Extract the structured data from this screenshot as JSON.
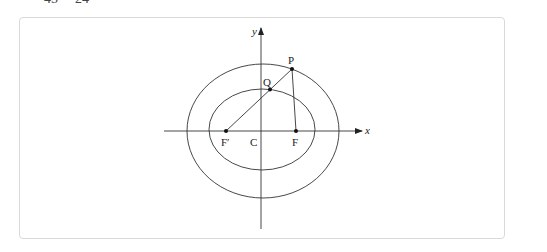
{
  "clipped_text": {
    "left": "45",
    "right": "24"
  },
  "figure": {
    "axes": {
      "x_label": "x",
      "y_label": "y"
    },
    "points": {
      "P": "P",
      "Q": "Q",
      "F_prime": "F′",
      "C": "C",
      "F": "F"
    }
  },
  "colors": {
    "stroke": "#333333",
    "frame_border": "#d9d9d9",
    "background": "#ffffff"
  }
}
